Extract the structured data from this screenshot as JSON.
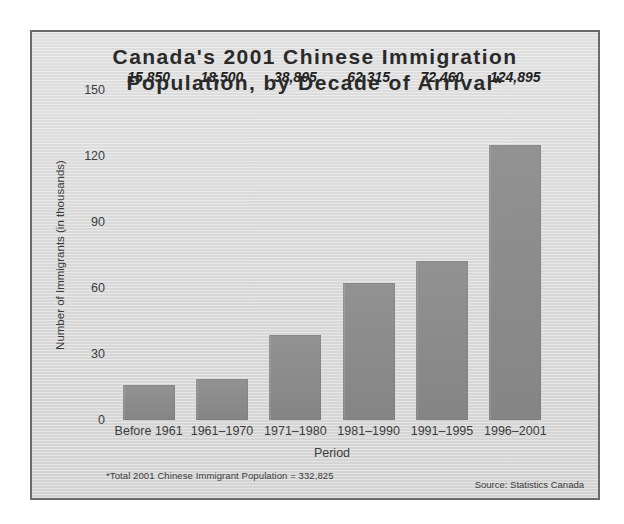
{
  "chart_data": {
    "type": "bar",
    "title": "Canada's 2001 Chinese Immigration Population, by Decade of Arrival*",
    "title_lines": [
      "Canada's 2001 Chinese Immigration",
      "Population, by Decade of Arrival*"
    ],
    "xlabel": "Period",
    "ylabel": "Number of Immigrants (in thousands)",
    "ylim": [
      0,
      150
    ],
    "yticks": [
      0,
      30,
      60,
      90,
      120,
      150
    ],
    "ytick_labels": [
      "0",
      "30",
      "60",
      "90",
      "120",
      "150"
    ],
    "grid": false,
    "legend": "none",
    "categories": [
      "Before 1961",
      "1961–1970",
      "1971–1980",
      "1981–1990",
      "1991–1995",
      "1996–2001"
    ],
    "values": [
      15850,
      18500,
      38805,
      62315,
      72460,
      124895
    ],
    "value_labels": [
      "15,850",
      "18,500",
      "38,805",
      "62,315",
      "72,460",
      "124,895"
    ],
    "bars": [
      {
        "category": "Before 1961",
        "value": 15850,
        "label": "15,850"
      },
      {
        "category": "1961–1970",
        "value": 18500,
        "label": "18,500"
      },
      {
        "category": "1971–1980",
        "value": 38805,
        "label": "38,805"
      },
      {
        "category": "1981–1990",
        "value": 62315,
        "label": "62,315"
      },
      {
        "category": "1991–1995",
        "value": 72460,
        "label": "72,460"
      },
      {
        "category": "1996–2001",
        "value": 124895,
        "label": "124,895"
      }
    ],
    "footnote": "*Total 2001 Chinese Immigrant Population = 332,825",
    "source": "Source: Statistics Canada",
    "colors": {
      "bar_fill": "#8c8c8c",
      "background": "#dedede",
      "frame_border": "#6b6b6b",
      "text": "#2a2a2a"
    }
  }
}
